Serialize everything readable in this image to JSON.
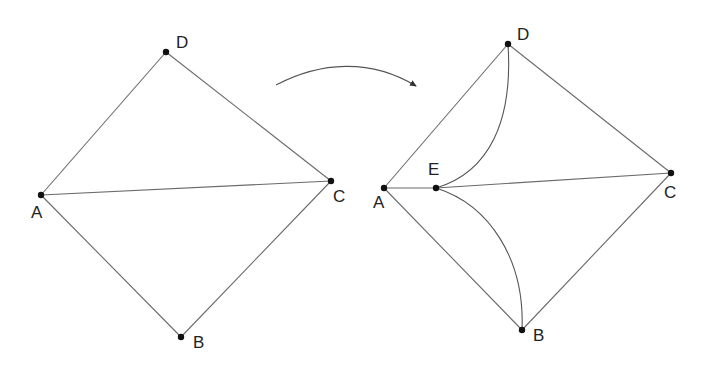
{
  "left_graph": {
    "vertices": [
      {
        "id": "A",
        "label": "A",
        "x": 41,
        "y": 195,
        "lx": 31,
        "ly": 218
      },
      {
        "id": "D",
        "label": "D",
        "x": 166,
        "y": 52,
        "lx": 176,
        "ly": 48
      },
      {
        "id": "C",
        "label": "C",
        "x": 331,
        "y": 181,
        "lx": 333,
        "ly": 202
      },
      {
        "id": "B",
        "label": "B",
        "x": 181,
        "y": 337,
        "lx": 193,
        "ly": 348
      }
    ],
    "edges": [
      [
        "A",
        "D"
      ],
      [
        "D",
        "C"
      ],
      [
        "A",
        "C"
      ],
      [
        "A",
        "B"
      ],
      [
        "B",
        "C"
      ]
    ]
  },
  "right_graph": {
    "vertices": [
      {
        "id": "A",
        "label": "A",
        "x": 384,
        "y": 188,
        "lx": 373,
        "ly": 208
      },
      {
        "id": "E",
        "label": "E",
        "x": 436,
        "y": 188,
        "lx": 428,
        "ly": 175
      },
      {
        "id": "D",
        "label": "D",
        "x": 508,
        "y": 44,
        "lx": 517,
        "ly": 40
      },
      {
        "id": "C",
        "label": "C",
        "x": 671,
        "y": 173,
        "lx": 664,
        "ly": 198
      },
      {
        "id": "B",
        "label": "B",
        "x": 522,
        "y": 330,
        "lx": 533,
        "ly": 341
      }
    ],
    "edges": [
      [
        "A",
        "D"
      ],
      [
        "D",
        "C"
      ],
      [
        "A",
        "E"
      ],
      [
        "E",
        "C"
      ],
      [
        "A",
        "B"
      ],
      [
        "B",
        "C"
      ]
    ],
    "curved_edges": [
      {
        "from": "E",
        "to": "D",
        "path": "M436,188 C490,172 513,120 508,44"
      },
      {
        "from": "E",
        "to": "B",
        "path": "M436,188 C490,205 525,260 522,330"
      }
    ]
  },
  "transform_arrow": {
    "path": "M276,85 C320,62 370,58 416,86",
    "direction": "left-to-right"
  }
}
